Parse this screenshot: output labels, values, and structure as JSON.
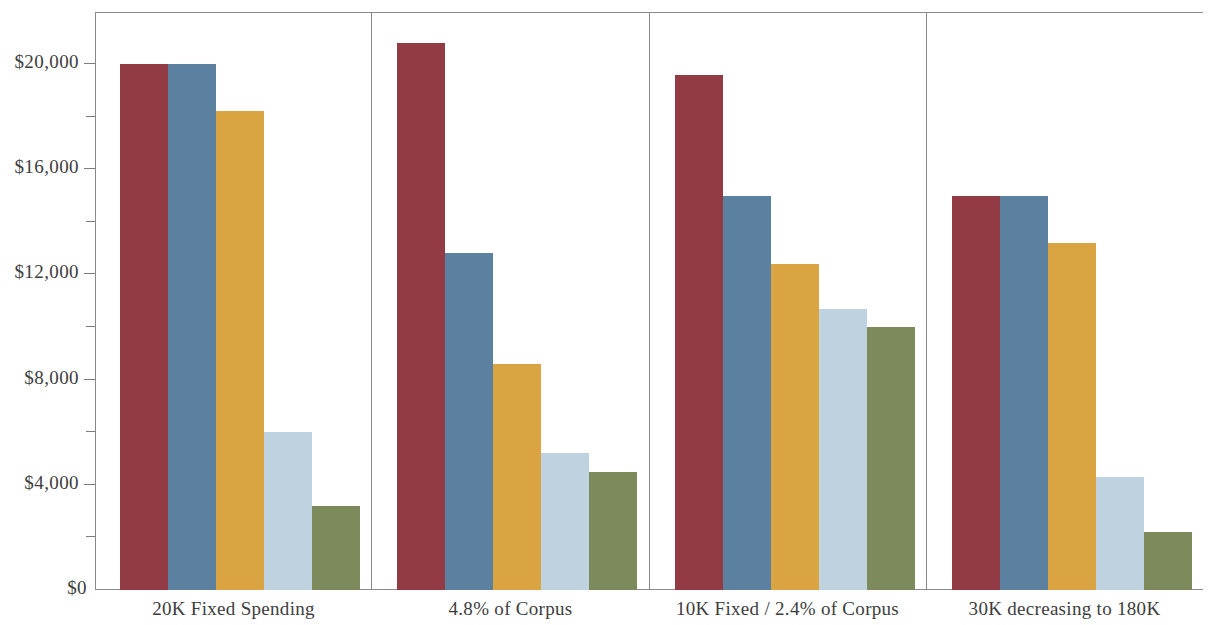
{
  "chart_data": {
    "type": "bar",
    "title": "",
    "subtitle": "",
    "xlabel": "",
    "ylabel": "",
    "ylim": [
      0,
      22000
    ],
    "grid": false,
    "legend_position": "none",
    "orientation": "vertical",
    "grouped": true,
    "panel_separators": true,
    "y_ticks_major": [
      {
        "value": 0,
        "label": "$0"
      },
      {
        "value": 4000,
        "label": "$4,000"
      },
      {
        "value": 8000,
        "label": "$8,000"
      },
      {
        "value": 12000,
        "label": "$12,000"
      },
      {
        "value": 16000,
        "label": "$16,000"
      },
      {
        "value": 20000,
        "label": "$20,000"
      }
    ],
    "y_ticks_minor": [
      2000,
      6000,
      10000,
      14000,
      18000
    ],
    "categories": [
      "20K Fixed Spending",
      "4.8% of Corpus",
      "10K Fixed / 2.4% of Corpus",
      "30K decreasing to 180K"
    ],
    "series": [
      {
        "name": "series-1",
        "color": "#933b44",
        "values": [
          20000,
          20800,
          19600,
          15000
        ]
      },
      {
        "name": "series-2",
        "color": "#5b80a0",
        "values": [
          20000,
          12800,
          15000,
          15000
        ]
      },
      {
        "name": "series-3",
        "color": "#d9a441",
        "values": [
          18200,
          8600,
          12400,
          13200
        ]
      },
      {
        "name": "series-4",
        "color": "#bfd2e0",
        "values": [
          6000,
          5200,
          10700,
          4300
        ]
      },
      {
        "name": "series-5",
        "color": "#7d8a5c",
        "values": [
          3200,
          4500,
          10000,
          2200
        ]
      }
    ],
    "axis_color": "#8a8a8a",
    "text_color": "#3d3d3d",
    "background": "#ffffff"
  }
}
